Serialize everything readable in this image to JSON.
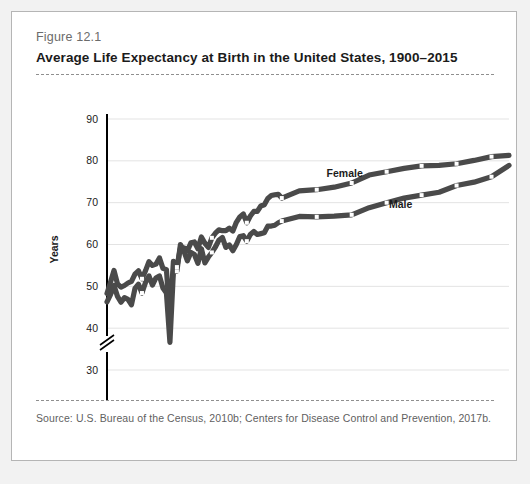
{
  "figure": {
    "number": "Figure 12.1",
    "title": "Average Life Expectancy at Birth in the United States, 1900–2015",
    "source": "Source:  U.S. Bureau of the Census, 2010b; Centers for Disease Control and Prevention, 2017b."
  },
  "colors": {
    "card_background": "#ffffff",
    "page_background": "#f2f2f2",
    "card_border": "#b5b5b5",
    "series_line": "#4a4a4a",
    "gridline": "#e3e3e3",
    "axis": "#000000",
    "title_text": "#1b1b1b",
    "muted_text": "#6b6b6b",
    "marker_fill": "#ffffff"
  },
  "chart_data": {
    "type": "line",
    "title": "Average Life Expectancy at Birth in the United States, 1900–2015",
    "xlabel": "",
    "ylabel": "Years",
    "xlim": [
      1900,
      2015
    ],
    "ylim": [
      30,
      90
    ],
    "axis_break": true,
    "axis_break_note": "y-axis broken between 0 and 30",
    "grid": true,
    "legend_position": "inline-labels",
    "ytick_labels": [
      "0",
      "30",
      "40",
      "50",
      "60",
      "70",
      "80",
      "90"
    ],
    "ytick_values": [
      0,
      30,
      40,
      50,
      60,
      70,
      80,
      90
    ],
    "xtick_labels": [
      "1900",
      "1910",
      "1920",
      "1930",
      "1940",
      "1950",
      "1960",
      "1970",
      "1980",
      "1990",
      "2000",
      "2010"
    ],
    "xtick_values": [
      1900,
      1910,
      1920,
      1930,
      1940,
      1950,
      1960,
      1970,
      1980,
      1990,
      2000,
      2010
    ],
    "annotations": [
      {
        "text": "Female",
        "x": 1968,
        "y": 76.2
      },
      {
        "text": "Male",
        "x": 1984,
        "y": 68.8
      }
    ],
    "series": [
      {
        "name": "Female",
        "x": [
          1900,
          1901,
          1902,
          1903,
          1904,
          1905,
          1906,
          1907,
          1908,
          1909,
          1910,
          1911,
          1912,
          1913,
          1914,
          1915,
          1916,
          1917,
          1918,
          1919,
          1920,
          1921,
          1922,
          1923,
          1924,
          1925,
          1926,
          1927,
          1928,
          1929,
          1930,
          1931,
          1932,
          1933,
          1934,
          1935,
          1936,
          1937,
          1938,
          1939,
          1940,
          1941,
          1942,
          1943,
          1944,
          1945,
          1946,
          1947,
          1948,
          1949,
          1950,
          1955,
          1960,
          1965,
          1970,
          1975,
          1980,
          1985,
          1990,
          1995,
          2000,
          2005,
          2010,
          2015
        ],
        "values": [
          48.3,
          51.0,
          53.8,
          50.6,
          49.8,
          50.2,
          50.8,
          51.2,
          52.9,
          53.7,
          51.8,
          53.7,
          55.9,
          55.0,
          55.3,
          56.8,
          54.3,
          54.0,
          42.2,
          56.0,
          54.6,
          59.2,
          59.2,
          58.5,
          60.4,
          60.6,
          59.0,
          61.8,
          60.3,
          59.3,
          61.6,
          62.7,
          63.5,
          63.3,
          63.3,
          63.9,
          63.2,
          65.3,
          66.6,
          67.3,
          65.2,
          66.8,
          67.9,
          67.9,
          69.2,
          69.5,
          71.0,
          71.7,
          71.9,
          72.0,
          71.1,
          72.8,
          73.1,
          73.7,
          74.7,
          76.6,
          77.4,
          78.2,
          78.8,
          78.9,
          79.3,
          80.1,
          81.0,
          81.3
        ]
      },
      {
        "name": "Male",
        "x": [
          1900,
          1901,
          1902,
          1903,
          1904,
          1905,
          1906,
          1907,
          1908,
          1909,
          1910,
          1911,
          1912,
          1913,
          1914,
          1915,
          1916,
          1917,
          1918,
          1919,
          1920,
          1921,
          1922,
          1923,
          1924,
          1925,
          1926,
          1927,
          1928,
          1929,
          1930,
          1931,
          1932,
          1933,
          1934,
          1935,
          1936,
          1937,
          1938,
          1939,
          1940,
          1941,
          1942,
          1943,
          1944,
          1945,
          1946,
          1947,
          1948,
          1949,
          1950,
          1955,
          1960,
          1965,
          1970,
          1975,
          1980,
          1985,
          1990,
          1995,
          2000,
          2005,
          2010,
          2015
        ],
        "values": [
          46.3,
          48.0,
          50.2,
          47.6,
          46.2,
          47.3,
          46.9,
          45.6,
          49.5,
          50.5,
          48.4,
          50.9,
          52.5,
          50.3,
          52.0,
          52.5,
          49.6,
          48.4,
          36.6,
          53.5,
          53.6,
          60.0,
          58.4,
          56.1,
          58.1,
          57.6,
          55.5,
          59.0,
          55.6,
          57.0,
          58.1,
          59.4,
          61.0,
          61.7,
          59.3,
          59.9,
          58.5,
          60.0,
          61.9,
          62.1,
          60.8,
          62.4,
          63.1,
          62.4,
          62.6,
          62.8,
          64.4,
          64.4,
          64.6,
          65.2,
          65.6,
          66.7,
          66.6,
          66.8,
          67.1,
          68.8,
          70.0,
          71.1,
          71.8,
          72.5,
          74.1,
          74.9,
          76.2,
          78.9
        ]
      }
    ]
  }
}
